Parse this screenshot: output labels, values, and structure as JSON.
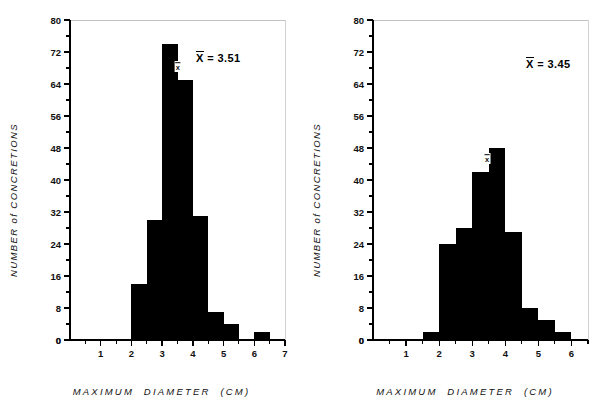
{
  "figure": {
    "panels": [
      {
        "name": "left-histogram",
        "mean_label_prefix": "X",
        "mean_label_text": " = 3.51",
        "xlabel": "MAXIMUM   DIAMETER   (CM)",
        "ylabel": "NUMBER  of  CONCRETIONS",
        "mean_tick_symbol": "x"
      },
      {
        "name": "right-histogram",
        "mean_label_prefix": "X",
        "mean_label_text": " = 3.45",
        "xlabel": "MAXIMUM   DIAMETER   (CM)",
        "ylabel": "NUMBER  of  CONCRETIONS",
        "mean_tick_symbol": "x"
      }
    ]
  },
  "chart_data": [
    {
      "type": "bar",
      "title": "",
      "subtitle": "",
      "xlabel": "MAXIMUM DIAMETER (CM)",
      "ylabel": "NUMBER of CONCRETIONS",
      "xlim": [
        0,
        7
      ],
      "ylim": [
        0,
        80
      ],
      "xticks": [
        0,
        1,
        2,
        3,
        4,
        5,
        6,
        7
      ],
      "xtick_labels": [
        "0",
        "1",
        "2",
        "3",
        "4",
        "5",
        "6",
        "7"
      ],
      "xminor_step": 0.5,
      "yticks": [
        0,
        8,
        16,
        24,
        32,
        40,
        48,
        56,
        64,
        72,
        80
      ],
      "ytick_labels": [
        "0",
        "8",
        "16",
        "24",
        "32",
        "40",
        "48",
        "56",
        "64",
        "72",
        "80"
      ],
      "yminor_step": 4,
      "grid": false,
      "legend": "none",
      "bin_width": 0.5,
      "bars": [
        {
          "x0": 2.0,
          "x1": 2.5,
          "value": 14
        },
        {
          "x0": 2.5,
          "x1": 3.0,
          "value": 30
        },
        {
          "x0": 3.0,
          "x1": 3.5,
          "value": 74
        },
        {
          "x0": 3.5,
          "x1": 4.0,
          "value": 65
        },
        {
          "x0": 4.0,
          "x1": 4.5,
          "value": 31
        },
        {
          "x0": 4.5,
          "x1": 5.0,
          "value": 7
        },
        {
          "x0": 5.0,
          "x1": 5.5,
          "value": 4
        },
        {
          "x0": 6.0,
          "x1": 6.5,
          "value": 2
        }
      ],
      "annotations": [
        {
          "text": "X = 3.51",
          "type": "mean-text",
          "x": 5.1,
          "y": 65
        },
        {
          "text": "x",
          "type": "mean-marker",
          "x": 3.51,
          "y": 67
        }
      ],
      "mean": 3.51,
      "bar_color": "#000000",
      "axis_color": "#000000"
    },
    {
      "type": "bar",
      "title": "",
      "subtitle": "",
      "xlabel": "MAXIMUM DIAMETER (CM)",
      "ylabel": "NUMBER of CONCRETIONS",
      "xlim": [
        0,
        6.5
      ],
      "ylim": [
        0,
        80
      ],
      "xticks": [
        0,
        1,
        2,
        3,
        4,
        5,
        6
      ],
      "xtick_labels": [
        "0",
        "1",
        "2",
        "3",
        "4",
        "5",
        "6"
      ],
      "xminor_step": 0.5,
      "yticks": [
        0,
        8,
        16,
        24,
        32,
        40,
        48,
        56,
        64,
        72,
        80
      ],
      "ytick_labels": [
        "0",
        "8",
        "16",
        "24",
        "32",
        "40",
        "48",
        "56",
        "64",
        "72",
        "80"
      ],
      "yminor_step": 4,
      "grid": false,
      "legend": "none",
      "bin_width": 0.5,
      "bars": [
        {
          "x0": 1.5,
          "x1": 2.0,
          "value": 2
        },
        {
          "x0": 2.0,
          "x1": 2.5,
          "value": 24
        },
        {
          "x0": 2.5,
          "x1": 3.0,
          "value": 28
        },
        {
          "x0": 3.0,
          "x1": 3.5,
          "value": 42
        },
        {
          "x0": 3.5,
          "x1": 4.0,
          "value": 48
        },
        {
          "x0": 4.0,
          "x1": 4.5,
          "value": 27
        },
        {
          "x0": 4.5,
          "x1": 5.0,
          "value": 8
        },
        {
          "x0": 5.0,
          "x1": 5.5,
          "value": 5
        },
        {
          "x0": 5.5,
          "x1": 6.0,
          "value": 2
        }
      ],
      "annotations": [
        {
          "text": "X = 3.45",
          "type": "mean-text",
          "x": 5.0,
          "y": 65
        },
        {
          "text": "x",
          "type": "mean-marker",
          "x": 3.45,
          "y": 44
        }
      ],
      "mean": 3.45,
      "bar_color": "#000000",
      "axis_color": "#000000"
    }
  ]
}
